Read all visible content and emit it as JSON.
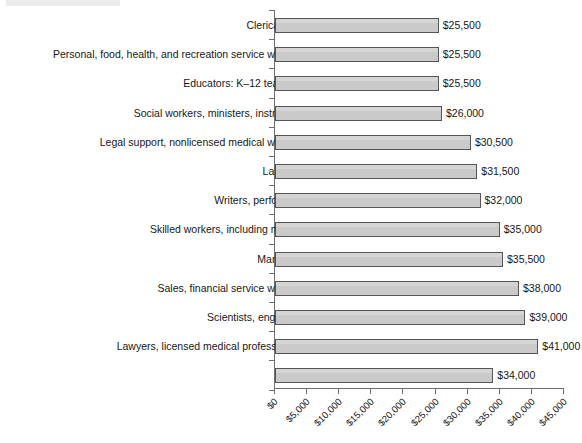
{
  "chart_data": {
    "type": "bar",
    "orientation": "horizontal",
    "title": "",
    "subtitle": "",
    "xlabel": "",
    "ylabel": "",
    "xlim": [
      0,
      45000
    ],
    "xtick_step": 5000,
    "grid": false,
    "legend": null,
    "value_label_format": "$#,##0",
    "bar_fill_color": "#cacaca",
    "bar_border_color": "#555555",
    "axis_color": "#6d6d6d",
    "categories": [
      "Clerical staff",
      "Personal, food, health, and recreation service workers",
      "Educators: K–12 teachers",
      "Social workers, ministers, instructors",
      "Legal support, nonlicensed medical workers",
      "Laborers",
      "Writers, performers",
      "Skilled workers, including military",
      "Managers",
      "Sales, financial service workers",
      "Scientists, engineers",
      "Lawyers, licensed medical professionals",
      "Total"
    ],
    "values": [
      25500,
      25500,
      25500,
      26000,
      30500,
      31500,
      32000,
      35000,
      35500,
      38000,
      39000,
      41000,
      34000
    ],
    "value_labels": [
      "$25,500",
      "$25,500",
      "$25,500",
      "$26,000",
      "$30,500",
      "$31,500",
      "$32,000",
      "$35,000",
      "$35,500",
      "$38,000",
      "$39,000",
      "$41,000",
      "$34,000"
    ],
    "xtick_values": [
      0,
      5000,
      10000,
      15000,
      20000,
      25000,
      30000,
      35000,
      40000,
      45000
    ],
    "xtick_labels": [
      "$0",
      "$5,000",
      "$10,000",
      "$15,000",
      "$20,000",
      "$25,000",
      "$30,000",
      "$35,000",
      "$40,000",
      "$45,000"
    ]
  }
}
